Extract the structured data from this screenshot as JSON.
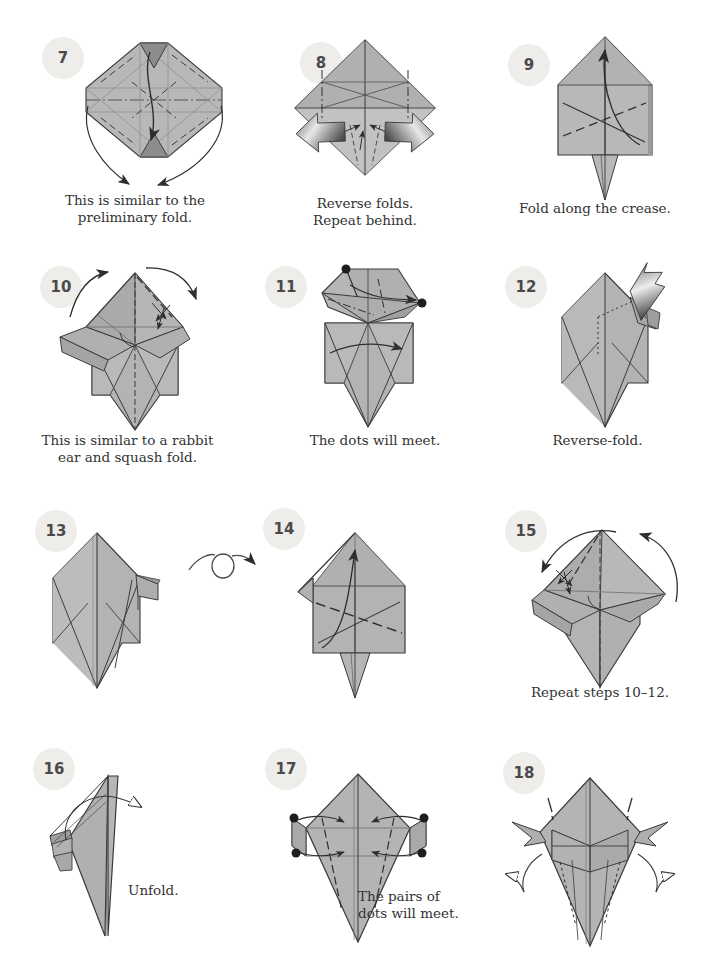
{
  "page": {
    "width": 706,
    "height": 954,
    "background": "#ffffff"
  },
  "style": {
    "paper_front": "#b4b4b4",
    "paper_back": "#8f8f8f",
    "paper_shadow": "#9d9d9d",
    "paper_highlight": "#c6c6c6",
    "outline": "#3b3b3b",
    "crease_line": "#6b6b6b",
    "badge_bg": "#eeedea",
    "badge_text": "#4a4a4a",
    "caption_text": "#333333",
    "arrow_stroke": "#2e2e2e",
    "push_arrow_dark": "#4a4a4a",
    "push_arrow_light": "#d8d8d8"
  },
  "steps": [
    {
      "number": "7",
      "caption": "This is similar to the\npreliminary fold.",
      "badge": {
        "x": 42,
        "y": 37
      },
      "figure": {
        "x": 80,
        "y": 30,
        "w": 160,
        "h": 155
      },
      "caption_pos": {
        "x": 40,
        "y": 192,
        "w": 190
      },
      "markers": {
        "turn_over": false,
        "dots": 0
      }
    },
    {
      "number": "8",
      "caption": "Reverse folds.\nRepeat behind.",
      "badge": {
        "x": 300,
        "y": 42
      },
      "figure": {
        "x": 330,
        "y": 35,
        "w": 150,
        "h": 150
      },
      "caption_pos": {
        "x": 335,
        "y": 195,
        "w": 150
      },
      "markers": {
        "turn_over": false,
        "dots": 0
      }
    },
    {
      "number": "9",
      "caption": "Fold along the crease.",
      "badge": {
        "x": 508,
        "y": 44
      },
      "figure": {
        "x": 545,
        "y": 30,
        "w": 125,
        "h": 165
      },
      "caption_pos": {
        "x": 520,
        "y": 200,
        "w": 175
      },
      "markers": {
        "turn_over": false,
        "dots": 0
      }
    },
    {
      "number": "10",
      "caption": "This is similar to a rabbit\near and squash fold.",
      "badge": {
        "x": 40,
        "y": 266
      },
      "figure": {
        "x": 60,
        "y": 258,
        "w": 155,
        "h": 165
      },
      "caption_pos": {
        "x": 30,
        "y": 432,
        "w": 200
      },
      "markers": {
        "turn_over": false,
        "dots": 0
      }
    },
    {
      "number": "11",
      "caption": "The dots will meet.",
      "badge": {
        "x": 265,
        "y": 266
      },
      "figure": {
        "x": 315,
        "y": 260,
        "w": 150,
        "h": 165
      },
      "caption_pos": {
        "x": 310,
        "y": 432,
        "w": 160
      },
      "markers": {
        "turn_over": false,
        "dots": 2
      }
    },
    {
      "number": "12",
      "caption": "Reverse-fold.",
      "badge": {
        "x": 505,
        "y": 266
      },
      "figure": {
        "x": 555,
        "y": 258,
        "w": 140,
        "h": 170
      },
      "caption_pos": {
        "x": 560,
        "y": 432,
        "w": 135
      },
      "markers": {
        "turn_over": false,
        "dots": 0
      }
    },
    {
      "number": "13",
      "caption": "",
      "badge": {
        "x": 35,
        "y": 510
      },
      "figure": {
        "x": 52,
        "y": 525,
        "w": 155,
        "h": 165
      },
      "caption_pos": {
        "x": 40,
        "y": 700,
        "w": 180
      },
      "markers": {
        "turn_over": true,
        "dots": 0
      }
    },
    {
      "number": "14",
      "caption": "",
      "badge": {
        "x": 263,
        "y": 508
      },
      "figure": {
        "x": 300,
        "y": 528,
        "w": 145,
        "h": 160
      },
      "caption_pos": {
        "x": 300,
        "y": 700,
        "w": 160
      },
      "markers": {
        "turn_over": false,
        "dots": 0
      }
    },
    {
      "number": "15",
      "caption": "Repeat steps 10–12.",
      "badge": {
        "x": 505,
        "y": 510
      },
      "figure": {
        "x": 540,
        "y": 520,
        "w": 160,
        "h": 165
      },
      "caption_pos": {
        "x": 515,
        "y": 684,
        "w": 170
      },
      "markers": {
        "turn_over": false,
        "dots": 0
      }
    },
    {
      "number": "16",
      "caption": "Unfold.",
      "badge": {
        "x": 35,
        "y": 750
      },
      "figure": {
        "x": 45,
        "y": 770,
        "w": 155,
        "h": 165
      },
      "caption_pos": {
        "x": 130,
        "y": 882,
        "w": 100
      },
      "markers": {
        "turn_over": false,
        "dots": 0
      }
    },
    {
      "number": "17",
      "caption": "The pairs of\ndots will meet.",
      "badge": {
        "x": 265,
        "y": 748
      },
      "figure": {
        "x": 285,
        "y": 765,
        "w": 145,
        "h": 175
      },
      "caption_pos": {
        "x": 358,
        "y": 890,
        "w": 120
      },
      "markers": {
        "turn_over": false,
        "dots": 4
      }
    },
    {
      "number": "18",
      "caption": "",
      "badge": {
        "x": 503,
        "y": 752
      },
      "figure": {
        "x": 545,
        "y": 770,
        "w": 155,
        "h": 175
      },
      "caption_pos": {
        "x": 540,
        "y": 930,
        "w": 150
      },
      "markers": {
        "turn_over": false,
        "dots": 0
      }
    }
  ],
  "symbols": {
    "turn_over_label": "turn-over-arrow",
    "turn_over_pos": {
      "x": 185,
      "y": 545,
      "w": 72,
      "h": 40
    }
  }
}
